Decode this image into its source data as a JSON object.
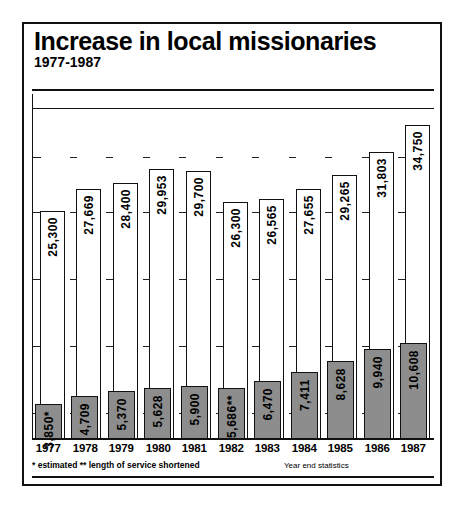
{
  "header": {
    "title": "Increase in local missionaries",
    "subtitle": "1977-1987"
  },
  "footnotes": {
    "left": "*  estimated    **  length of service shortened",
    "right": "Year end statistics"
  },
  "chart_data": {
    "type": "bar",
    "title": "Increase in local missionaries",
    "subtitle": "1977-1987",
    "xlabel": "",
    "ylabel": "",
    "ylim": [
      0,
      37000
    ],
    "grid": true,
    "legend_position": "none",
    "categories": [
      "1977",
      "1978",
      "1979",
      "1980",
      "1981",
      "1982",
      "1983",
      "1984",
      "1985",
      "1986",
      "1987"
    ],
    "series": [
      {
        "name": "total",
        "color": "#ffffff",
        "values": [
          25300,
          27669,
          28400,
          29953,
          29700,
          26300,
          26565,
          27655,
          29265,
          31803,
          34750
        ],
        "labels": [
          "25,300",
          "27,669",
          "28,400",
          "29,953",
          "29,700",
          "26,300",
          "26,565",
          "27,655",
          "29,265",
          "31,803",
          "34,750"
        ]
      },
      {
        "name": "local",
        "color": "#8d8d8d",
        "values": [
          3850,
          4709,
          5370,
          5628,
          5900,
          5686,
          6470,
          7411,
          8628,
          9940,
          10608
        ],
        "labels": [
          "3,850*",
          "4,709",
          "5,370",
          "5,628",
          "5,900",
          "5,686**",
          "6,470",
          "7,411",
          "8,628",
          "9,940",
          "10,608"
        ]
      }
    ],
    "annotations": [
      "*  estimated",
      "**  length of service shortened",
      "Year end statistics"
    ]
  }
}
